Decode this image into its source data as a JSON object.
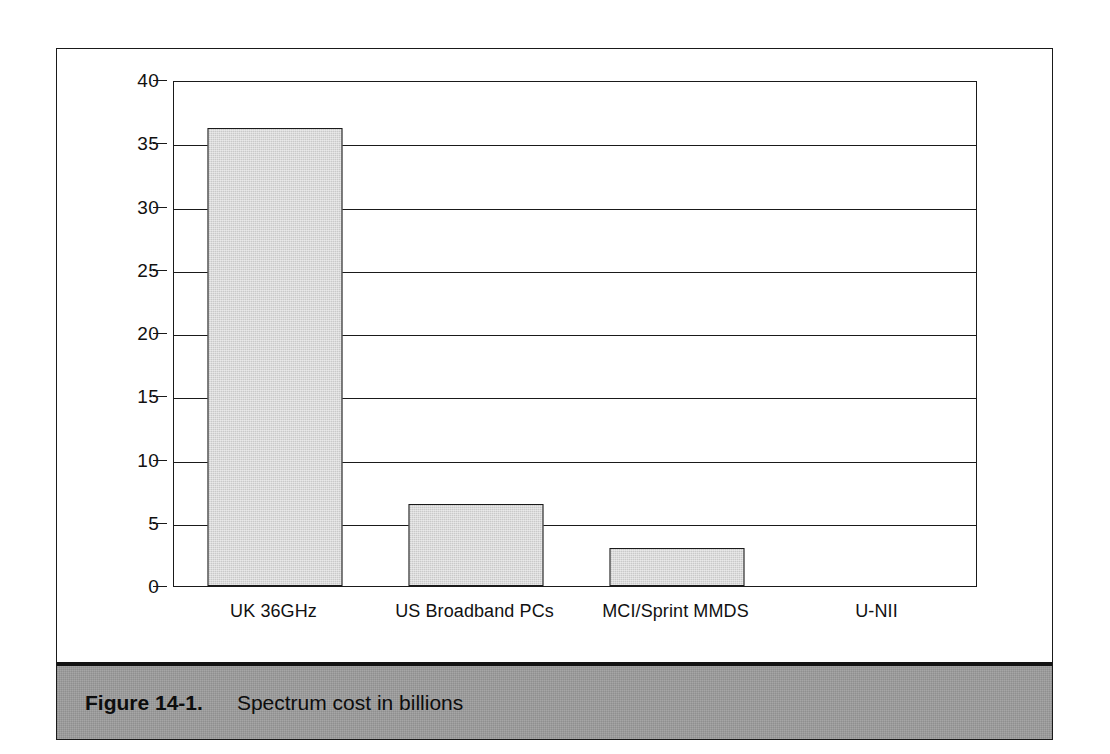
{
  "figure": {
    "caption_number": "Figure 14-1.",
    "caption_text": "Spectrum cost in billions"
  },
  "chart_data": {
    "type": "bar",
    "title": "Spectrum cost in billions",
    "categories": [
      "UK 36GHz",
      "US Broadband PCs",
      "MCI/Sprint MMDS",
      "U-NII"
    ],
    "values": [
      36.2,
      6.5,
      3.0,
      0
    ],
    "xlabel": "",
    "ylabel": "",
    "ylim": [
      0,
      40
    ],
    "ytick_interval": 5,
    "yticks": [
      "0",
      "5",
      "10",
      "15",
      "20",
      "25",
      "30",
      "35",
      "40"
    ],
    "grid": "horizontal",
    "legend": "none",
    "bar_fill_color": "#c9c9c9",
    "bar_border_color": "#1a1a1a",
    "caption_bar_color": "#9b9b9b"
  }
}
